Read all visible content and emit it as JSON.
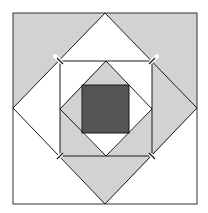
{
  "diagram": {
    "title": "",
    "colors": {
      "background": "#ffffff",
      "light_fill": "#d2d2d2",
      "white_fill": "#ffffff",
      "dark_fill": "#555555",
      "stroke": "#1a1a1a",
      "corner_mark": "#ffffff"
    },
    "outer_square": {
      "x1": 13,
      "y1": 13,
      "x2": 197,
      "y2": 204
    },
    "outer_diamond": {
      "top": [
        105,
        13
      ],
      "right": [
        197,
        108
      ],
      "bottom": [
        105,
        204
      ],
      "left": [
        13,
        108
      ]
    },
    "inner_square": {
      "x1": 60,
      "y1": 61,
      "x2": 152,
      "y2": 156
    },
    "inner_diamond": {
      "top": [
        106,
        61
      ],
      "right": [
        152,
        109
      ],
      "bottom": [
        106,
        156
      ],
      "left": [
        60,
        109
      ]
    },
    "center_square": {
      "x1": 82,
      "y1": 85,
      "x2": 129,
      "y2": 133
    },
    "regions": [
      {
        "name": "outer-corner-top-left",
        "fill": "light"
      },
      {
        "name": "outer-corner-top-right",
        "fill": "light"
      },
      {
        "name": "outer-corner-bottom-left",
        "fill": "white"
      },
      {
        "name": "outer-corner-bottom-right",
        "fill": "white"
      },
      {
        "name": "diamond-triangle-top",
        "fill": "white"
      },
      {
        "name": "diamond-triangle-right",
        "fill": "light"
      },
      {
        "name": "diamond-triangle-bottom",
        "fill": "light"
      },
      {
        "name": "diamond-triangle-left",
        "fill": "white"
      },
      {
        "name": "inner-corner-top-left",
        "fill": "white"
      },
      {
        "name": "inner-corner-top-right",
        "fill": "white"
      },
      {
        "name": "inner-corner-bottom-left",
        "fill": "light"
      },
      {
        "name": "inner-corner-bottom-right",
        "fill": "light"
      },
      {
        "name": "inner-diamond-top",
        "fill": "light"
      },
      {
        "name": "inner-diamond-left",
        "fill": "light"
      },
      {
        "name": "inner-diamond-right",
        "fill": "white"
      },
      {
        "name": "inner-diamond-bottom",
        "fill": "white"
      },
      {
        "name": "center-square",
        "fill": "dark"
      }
    ],
    "corner_marks": [
      "top-left",
      "top-right",
      "bottom-left",
      "bottom-right"
    ]
  }
}
